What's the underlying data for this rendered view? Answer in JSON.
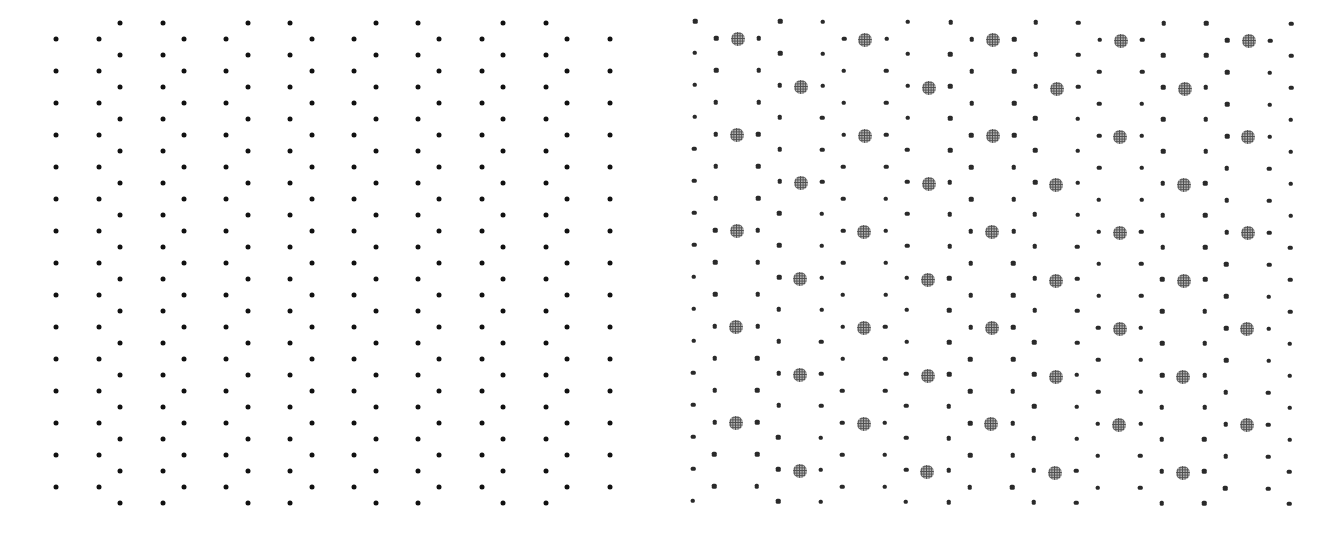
{
  "figure": {
    "background": "#ffffff",
    "panels": [
      {
        "id": "left",
        "label": "regular-dot-lattice",
        "origin_x": 56,
        "column_spacing": 21.3,
        "column_count": 27,
        "skip_column_mod3": 1,
        "phase_a_columns_mod6": [
          0,
          2
        ],
        "phase_b_columns_mod6": [
          3,
          5
        ],
        "row_spacing": 32,
        "phase_a_rows": {
          "start_y": 39,
          "count": 15
        },
        "phase_b_rows": {
          "start_y": 23,
          "count": 16
        },
        "small_dot_color": "#111111",
        "rotation_deg": 0
      },
      {
        "id": "right",
        "label": "dot-lattice-with-gray-targets",
        "origin_x": 695,
        "column_spacing": 21.3,
        "column_count": 29,
        "phase_a_columns_mod6": [
          0,
          4
        ],
        "phase_b_columns_mod6": [
          1,
          3
        ],
        "big_b_columns_mod6": [
          2
        ],
        "big_a_columns_mod6": [
          5
        ],
        "row_spacing": 32,
        "phase_a_rows": {
          "start_y": 21,
          "count": 16
        },
        "phase_b_rows": {
          "start_y": 38,
          "count": 15
        },
        "big_row_spacing": 96,
        "big_b_rows": {
          "start_y": 39,
          "count": 5
        },
        "big_a_rows": {
          "start_y": 87,
          "count": 5
        },
        "small_dot_color": "#2a2a2a",
        "big_dot_color": "#b0b0b0",
        "rotation_deg": 0.25
      }
    ]
  }
}
